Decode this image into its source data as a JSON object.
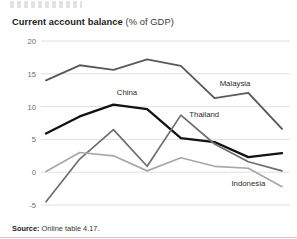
{
  "figure": {
    "title_bold": "Current account balance",
    "title_light": "(% of GDP)",
    "source_bold": "Source:",
    "source_rest": "Online table 4.17."
  },
  "chart_data": {
    "type": "line",
    "title": "Current account balance (% of GDP)",
    "xlabel": "",
    "ylabel": "",
    "categories": [
      "2005",
      "2006",
      "2007",
      "2008",
      "2009",
      "2010",
      "2011",
      "2012"
    ],
    "x": [
      2005,
      2006,
      2007,
      2008,
      2009,
      2010,
      2011,
      2012
    ],
    "ylim": [
      -5,
      20
    ],
    "yticks": [
      -5,
      0,
      5,
      10,
      15,
      20
    ],
    "ytick_labels": [
      "-5",
      "0",
      "5",
      "10",
      "15",
      "20"
    ],
    "xlim": [
      2005,
      2012
    ],
    "grid": "horizontal",
    "legend": "inline-annotations",
    "series": [
      {
        "name": "Malaysia",
        "color": "#5a5a5a",
        "width": 1.9,
        "values": [
          14.0,
          16.3,
          15.6,
          17.2,
          16.2,
          11.3,
          12.1,
          6.6
        ],
        "label_x": 2010.15,
        "label_y": 13.2
      },
      {
        "name": "China",
        "color": "#121212",
        "width": 2.3,
        "values": [
          5.9,
          8.5,
          10.3,
          9.6,
          5.2,
          4.6,
          2.3,
          2.9
        ],
        "label_x": 2007.1,
        "label_y": 11.7
      },
      {
        "name": "Thailand",
        "color": "#6e6e6e",
        "width": 1.7,
        "values": [
          -4.5,
          2.0,
          6.5,
          0.9,
          8.7,
          4.3,
          1.6,
          0.2
        ],
        "label_x": 2009.25,
        "label_y": 8.4
      },
      {
        "name": "Indonesia",
        "color": "#a8a8a8",
        "width": 1.7,
        "values": [
          0.1,
          3.0,
          2.5,
          0.2,
          2.2,
          0.9,
          0.6,
          -2.2
        ],
        "label_x": 2010.5,
        "label_y": -2.1
      }
    ]
  }
}
